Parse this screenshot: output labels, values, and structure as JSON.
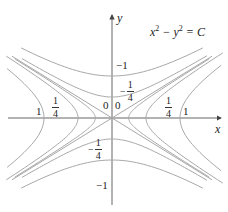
{
  "diagram": {
    "equation": {
      "lhs_x": "x",
      "exp": "2",
      "minus": " − ",
      "lhs_y": "y",
      "equals": " = ",
      "rhs": "C"
    },
    "axes": {
      "x_label": "x",
      "y_label": "y"
    },
    "level_labels": {
      "right_1": "1",
      "left_1": "1",
      "right_quarter": {
        "num": "1",
        "den": "4"
      },
      "left_quarter": {
        "num": "1",
        "den": "4"
      },
      "zero_left": "0",
      "zero_right": "0",
      "top_minus_1": "−1",
      "bottom_minus_1": "−1",
      "top_minus_quarter": {
        "sign": "−",
        "num": "1",
        "den": "4"
      },
      "bottom_minus_quarter": {
        "sign": "−",
        "num": "1",
        "den": "4"
      }
    },
    "colors": {
      "curve": "#a8a8a8",
      "axis": "#555555",
      "text": "#222222"
    },
    "level_values": [
      "1",
      "1/4",
      "0",
      "-1/4",
      "-1"
    ]
  }
}
